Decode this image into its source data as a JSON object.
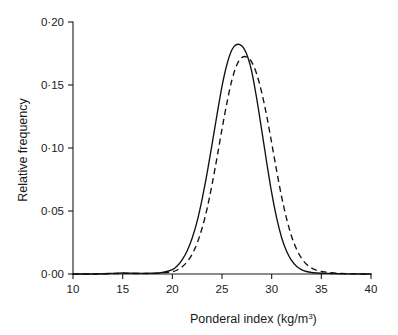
{
  "chart_data": {
    "type": "line",
    "title": "",
    "xlabel": "Ponderal index (kg/m",
    "xlabel_sup": "3",
    "xlabel_suffix": ")",
    "ylabel": "Relative frequency",
    "xlim": [
      10,
      40
    ],
    "ylim": [
      0.0,
      0.2
    ],
    "xticks": [
      10,
      15,
      20,
      25,
      30,
      35,
      40
    ],
    "xticklabels": [
      "10",
      "15",
      "20",
      "25",
      "30",
      "35",
      "40"
    ],
    "yticks": [
      0.0,
      0.05,
      0.1,
      0.15,
      0.2
    ],
    "yticklabels": [
      "0·00",
      "0·05",
      "0·10",
      "0·15",
      "0·20"
    ],
    "grid": false,
    "legend": "none",
    "line_color": "#111111",
    "series": [
      {
        "name": "solid-distribution",
        "style": "solid",
        "peak_x": 26.8,
        "peak_y": 0.182,
        "x": [
          10,
          12,
          14,
          15,
          16,
          17,
          18,
          19,
          20,
          20.5,
          21,
          21.5,
          22,
          22.5,
          23,
          23.5,
          24,
          24.5,
          25,
          25.5,
          26,
          26.4,
          26.8,
          27.2,
          27.6,
          28,
          28.5,
          29,
          29.5,
          30,
          30.5,
          31,
          31.5,
          32,
          32.5,
          33,
          33.5,
          34,
          35,
          36,
          37,
          38,
          39,
          40
        ],
        "y": [
          0.0,
          0.0,
          0.0005,
          0.0008,
          0.0006,
          0.0005,
          0.0006,
          0.0012,
          0.0035,
          0.0065,
          0.0115,
          0.0185,
          0.0285,
          0.042,
          0.0595,
          0.08,
          0.103,
          0.1265,
          0.149,
          0.1665,
          0.178,
          0.1818,
          0.182,
          0.179,
          0.172,
          0.1605,
          0.139,
          0.114,
          0.0885,
          0.0645,
          0.0445,
          0.029,
          0.018,
          0.0108,
          0.0062,
          0.0035,
          0.002,
          0.0012,
          0.0006,
          0.0004,
          0.0002,
          0.0001,
          0.0,
          0.0
        ]
      },
      {
        "name": "dashed-distribution",
        "style": "dashed",
        "peak_x": 27.5,
        "peak_y": 0.172,
        "x": [
          10,
          12,
          14,
          15,
          16,
          17,
          18,
          19,
          20,
          20.5,
          21,
          21.5,
          22,
          22.5,
          23,
          23.5,
          24,
          24.5,
          25,
          25.5,
          26,
          26.5,
          27,
          27.5,
          28,
          28.5,
          29,
          29.5,
          30,
          30.5,
          31,
          31.5,
          32,
          32.5,
          33,
          33.5,
          34,
          34.5,
          35,
          35.5,
          36,
          37,
          38,
          39,
          40
        ],
        "y": [
          0.0,
          0.0,
          0.0003,
          0.0005,
          0.0004,
          0.0004,
          0.0005,
          0.0008,
          0.0018,
          0.0032,
          0.0058,
          0.0098,
          0.0158,
          0.0245,
          0.0365,
          0.052,
          0.071,
          0.0925,
          0.115,
          0.136,
          0.154,
          0.166,
          0.1718,
          0.1722,
          0.168,
          0.1585,
          0.144,
          0.1255,
          0.104,
          0.082,
          0.0615,
          0.044,
          0.03,
          0.0198,
          0.0126,
          0.0078,
          0.0048,
          0.003,
          0.002,
          0.0015,
          0.001,
          0.0005,
          0.0002,
          0.0,
          0.0
        ]
      }
    ]
  }
}
